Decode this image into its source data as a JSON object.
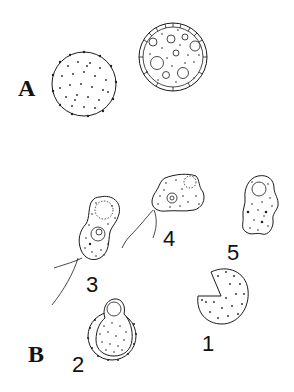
{
  "figure": {
    "panels": [
      {
        "label": "A",
        "cells": [
          {
            "id": "A-left",
            "description": "spherical cyst with spiny surface, granular cytoplasm"
          },
          {
            "id": "A-right",
            "description": "spherical cyst with double wall and vacuoles"
          }
        ]
      },
      {
        "label": "B",
        "stages": [
          {
            "number": "1",
            "description": "cell fragment / notched round form"
          },
          {
            "number": "2",
            "description": "excystation: amoeba emerging from cyst"
          },
          {
            "number": "3",
            "description": "flagellate form with nucleus and vacuole, two flagella"
          },
          {
            "number": "4",
            "description": "flagellate-amoeboid transitional form with flagella"
          },
          {
            "number": "5",
            "description": "amoeboid trophozoite with contractile vacuole"
          }
        ]
      }
    ],
    "colors": {
      "ink": "#1a1a1a",
      "background": "#ffffff"
    }
  }
}
